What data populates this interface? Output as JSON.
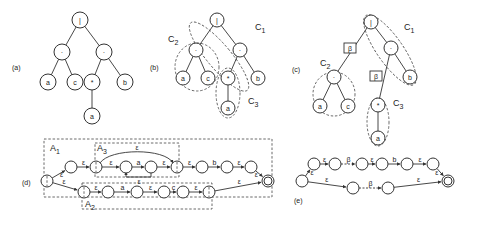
{
  "panels": {
    "a": "(a)",
    "b": "(b)",
    "c": "(c)",
    "d": "(d)",
    "e": "(e)"
  },
  "symbols": {
    "alt": "|",
    "concat": "·",
    "star": "*",
    "beta": "β",
    "eps": "ε"
  },
  "letters": {
    "a": "a",
    "b": "b",
    "c": "c"
  },
  "clusters": {
    "C1": "C",
    "C1_sub": "1",
    "C2": "C",
    "C2_sub": "2",
    "C3": "C",
    "C3_sub": "3"
  },
  "automaton_regions": {
    "A1": "A",
    "A1_sub": "1",
    "A2": "A",
    "A2_sub": "2",
    "A3": "A",
    "A3_sub": "3"
  },
  "tree_a": {
    "nodes": [
      {
        "id": "root",
        "label": "|",
        "x": 80,
        "y": 20
      },
      {
        "id": "cat1",
        "label": "·",
        "x": 62,
        "y": 52
      },
      {
        "id": "cat2",
        "label": "·",
        "x": 104,
        "y": 52
      },
      {
        "id": "a1",
        "label": "a",
        "x": 48,
        "y": 82
      },
      {
        "id": "c",
        "label": "c",
        "x": 75,
        "y": 82
      },
      {
        "id": "star",
        "label": "*",
        "x": 92,
        "y": 82
      },
      {
        "id": "b",
        "label": "b",
        "x": 125,
        "y": 82
      },
      {
        "id": "a2",
        "label": "a",
        "x": 92,
        "y": 116
      }
    ],
    "edges": [
      [
        "root",
        "cat1"
      ],
      [
        "root",
        "cat2"
      ],
      [
        "cat1",
        "a1"
      ],
      [
        "cat1",
        "c"
      ],
      [
        "cat2",
        "star"
      ],
      [
        "cat2",
        "b"
      ],
      [
        "star",
        "a2"
      ]
    ]
  },
  "tree_b": {
    "nodes": [
      {
        "id": "root",
        "label": "|",
        "x": 217,
        "y": 20
      },
      {
        "id": "cat1",
        "label": "·",
        "x": 196,
        "y": 50
      },
      {
        "id": "cat2",
        "label": "·",
        "x": 240,
        "y": 50
      },
      {
        "id": "a1",
        "label": "a",
        "x": 183,
        "y": 78
      },
      {
        "id": "c",
        "label": "c",
        "x": 208,
        "y": 78
      },
      {
        "id": "star",
        "label": "*",
        "x": 228,
        "y": 78
      },
      {
        "id": "b",
        "label": "b",
        "x": 258,
        "y": 78
      },
      {
        "id": "a2",
        "label": "a",
        "x": 228,
        "y": 108
      }
    ],
    "edges": [
      [
        "root",
        "cat1"
      ],
      [
        "root",
        "cat2"
      ],
      [
        "cat1",
        "a1"
      ],
      [
        "cat1",
        "c"
      ],
      [
        "cat2",
        "star"
      ],
      [
        "cat2",
        "b"
      ],
      [
        "star",
        "a2"
      ]
    ]
  },
  "tree_c": {
    "nodes": [
      {
        "id": "root",
        "label": "|",
        "x": 371,
        "y": 22
      },
      {
        "id": "cat1",
        "label": "·",
        "x": 334,
        "y": 77
      },
      {
        "id": "cat2",
        "label": "·",
        "x": 391,
        "y": 48
      },
      {
        "id": "a1",
        "label": "a",
        "x": 320,
        "y": 106
      },
      {
        "id": "c",
        "label": "c",
        "x": 348,
        "y": 106
      },
      {
        "id": "star",
        "label": "*",
        "x": 378,
        "y": 105
      },
      {
        "id": "b",
        "label": "b",
        "x": 410,
        "y": 77
      },
      {
        "id": "a2",
        "label": "a",
        "x": 378,
        "y": 138
      }
    ],
    "edges": [
      [
        "root",
        "cat1"
      ],
      [
        "root",
        "cat2"
      ],
      [
        "cat1",
        "a1"
      ],
      [
        "cat1",
        "c"
      ],
      [
        "cat2",
        "star"
      ],
      [
        "cat2",
        "b"
      ],
      [
        "star",
        "a2"
      ]
    ],
    "betas": [
      {
        "x": 350,
        "y": 48
      },
      {
        "x": 376,
        "y": 76
      }
    ]
  },
  "nfa_d": {
    "states": [
      {
        "id": "s0",
        "x": 47,
        "y": 181,
        "initial": true,
        "dashed": true
      },
      {
        "id": "s1",
        "x": 71,
        "y": 167
      },
      {
        "id": "s2",
        "x": 96,
        "y": 167,
        "dashed": true
      },
      {
        "id": "s3",
        "x": 126,
        "y": 167
      },
      {
        "id": "s4",
        "x": 151,
        "y": 167
      },
      {
        "id": "s5",
        "x": 177,
        "y": 167,
        "dashed": true
      },
      {
        "id": "s6",
        "x": 202,
        "y": 167
      },
      {
        "id": "s7",
        "x": 227,
        "y": 167
      },
      {
        "id": "s8",
        "x": 251,
        "y": 167
      },
      {
        "id": "f",
        "x": 268,
        "y": 181,
        "final": true
      },
      {
        "id": "t0",
        "x": 84,
        "y": 192,
        "dashed": true
      },
      {
        "id": "t1",
        "x": 108,
        "y": 192
      },
      {
        "id": "t2",
        "x": 137,
        "y": 192
      },
      {
        "id": "t3",
        "x": 164,
        "y": 192
      },
      {
        "id": "t4",
        "x": 183,
        "y": 192
      },
      {
        "id": "t5",
        "x": 209,
        "y": 192,
        "dashed": true
      }
    ],
    "edges": [
      {
        "from": "s0",
        "to": "s1",
        "label": "ε"
      },
      {
        "from": "s1",
        "to": "s2",
        "label": "ε"
      },
      {
        "from": "s2",
        "to": "s3",
        "label": "ε"
      },
      {
        "from": "s3",
        "to": "s4",
        "label": "a"
      },
      {
        "from": "s4",
        "to": "s5",
        "label": "ε"
      },
      {
        "from": "s5",
        "to": "s6",
        "label": "ε"
      },
      {
        "from": "s6",
        "to": "s7",
        "label": "b"
      },
      {
        "from": "s7",
        "to": "s8",
        "label": "ε"
      },
      {
        "from": "s8",
        "to": "f",
        "label": "ε"
      },
      {
        "from": "s0",
        "to": "t0",
        "label": "ε"
      },
      {
        "from": "t0",
        "to": "t1",
        "label": "ε"
      },
      {
        "from": "t1",
        "to": "t2",
        "label": "a"
      },
      {
        "from": "t2",
        "to": "t3",
        "label": "ε"
      },
      {
        "from": "t3",
        "to": "t4",
        "label": "c"
      },
      {
        "from": "t4",
        "to": "t5",
        "label": "ε"
      },
      {
        "from": "t5",
        "to": "f",
        "label": "ε"
      }
    ]
  },
  "nfa_e": {
    "states": [
      {
        "id": "e0",
        "x": 302,
        "y": 181
      },
      {
        "id": "e1",
        "x": 314,
        "y": 164
      },
      {
        "id": "e2",
        "x": 335,
        "y": 164
      },
      {
        "id": "e3",
        "x": 362,
        "y": 164
      },
      {
        "id": "e4",
        "x": 382,
        "y": 164
      },
      {
        "id": "e5",
        "x": 407,
        "y": 164
      },
      {
        "id": "e6",
        "x": 433,
        "y": 164
      },
      {
        "id": "e7",
        "x": 353,
        "y": 188
      },
      {
        "id": "e8",
        "x": 388,
        "y": 188
      },
      {
        "id": "ef",
        "x": 448,
        "y": 181,
        "final": true
      }
    ],
    "edges": [
      {
        "from": "e0",
        "to": "e1",
        "label": "ε"
      },
      {
        "from": "e1",
        "to": "e2",
        "label": "ε"
      },
      {
        "from": "e2",
        "to": "e3",
        "label": "β",
        "dashed": true
      },
      {
        "from": "e3",
        "to": "e4",
        "label": "ε"
      },
      {
        "from": "e4",
        "to": "e5",
        "label": "b"
      },
      {
        "from": "e5",
        "to": "e6",
        "label": "ε"
      },
      {
        "from": "e6",
        "to": "ef",
        "label": "ε"
      },
      {
        "from": "e0",
        "to": "e7",
        "label": "ε"
      },
      {
        "from": "e7",
        "to": "e8",
        "label": "β",
        "dashed": true
      },
      {
        "from": "e8",
        "to": "ef",
        "label": "ε"
      }
    ]
  }
}
